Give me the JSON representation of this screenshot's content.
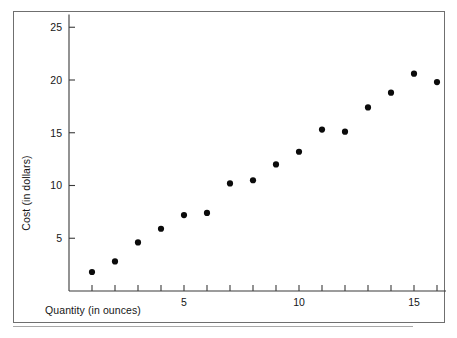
{
  "figure": {
    "background_color": "#ffffff",
    "frame_color": "#6f6f6f",
    "axis_color": "#3a3a3a",
    "point_color": "#0b0b0b"
  },
  "chart_data": {
    "type": "scatter",
    "title": "",
    "xlabel": "Quantity (in ounces)",
    "ylabel": "Cost (in dollars)",
    "xlim": [
      0,
      18.8
    ],
    "ylim": [
      0,
      26.2
    ],
    "grid": false,
    "legend": null,
    "x_tick_values": [
      1,
      2,
      3,
      4,
      5,
      6,
      7,
      8,
      9,
      10,
      11,
      12,
      13,
      14,
      15,
      16,
      17,
      18
    ],
    "x_tick_labels": [
      "",
      "",
      "",
      "",
      "5",
      "",
      "",
      "",
      "",
      "10",
      "",
      "",
      "",
      "",
      "15",
      "",
      "",
      ""
    ],
    "y_tick_values": [
      5,
      10,
      15,
      20,
      25
    ],
    "y_tick_labels": [
      "5",
      "10",
      "15",
      "20",
      "25"
    ],
    "x": [
      1,
      2,
      3,
      4,
      5,
      6,
      7,
      8,
      9,
      10,
      11,
      12,
      13,
      14,
      15,
      16,
      17,
      18
    ],
    "y": [
      1.8,
      2.8,
      4.6,
      5.9,
      7.2,
      7.4,
      10.2,
      10.5,
      12.0,
      13.2,
      15.3,
      15.1,
      17.4,
      18.8,
      20.6,
      19.8,
      21.8,
      23.0
    ],
    "points": [
      {
        "x": 1,
        "y": 1.8
      },
      {
        "x": 2,
        "y": 2.8
      },
      {
        "x": 3,
        "y": 4.6
      },
      {
        "x": 4,
        "y": 5.9
      },
      {
        "x": 5,
        "y": 7.2
      },
      {
        "x": 6,
        "y": 7.4
      },
      {
        "x": 7,
        "y": 10.2
      },
      {
        "x": 8,
        "y": 10.5
      },
      {
        "x": 9,
        "y": 12.0
      },
      {
        "x": 10,
        "y": 13.2
      },
      {
        "x": 11,
        "y": 15.3
      },
      {
        "x": 12,
        "y": 15.1
      },
      {
        "x": 13,
        "y": 17.4
      },
      {
        "x": 14,
        "y": 18.8
      },
      {
        "x": 15,
        "y": 20.6
      },
      {
        "x": 16,
        "y": 19.8
      },
      {
        "x": 17,
        "y": 21.8
      },
      {
        "x": 18,
        "y": 23.0
      }
    ],
    "marker": "filled-circle",
    "marker_radius_px": 3.1
  }
}
